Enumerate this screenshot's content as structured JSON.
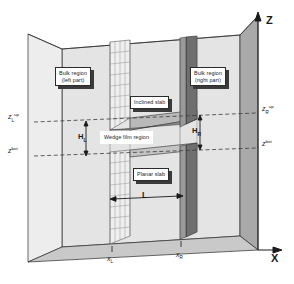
{
  "figure": {
    "type": "3d-schematic"
  },
  "axes": {
    "z_label": "Z",
    "x_label": "X",
    "x_ticks": [
      {
        "id": "xL",
        "base": "x",
        "sub": "L"
      },
      {
        "id": "xR",
        "base": "x",
        "sub": "R"
      }
    ],
    "z_ticks_left": [
      {
        "id": "zL_up",
        "base": "z",
        "sub": "L",
        "sup": "up"
      },
      {
        "id": "zL_bot",
        "base": "z",
        "sub": "",
        "sup": "bot"
      }
    ],
    "z_ticks_right": [
      {
        "id": "zR_up",
        "base": "z",
        "sub": "R",
        "sup": "up"
      },
      {
        "id": "zR_bot",
        "base": "z",
        "sub": "",
        "sup": "bot"
      }
    ]
  },
  "callouts": {
    "bulk_left": {
      "line1": "Bulk region",
      "line2": "(left part)"
    },
    "bulk_right": {
      "line1": "Bulk region",
      "line2": "(right part)"
    },
    "inclined_slab": {
      "line1": "Inclined slab"
    },
    "wedge_film": {
      "line1": "Wedge film region"
    },
    "planar_slab": {
      "line1": "Planar slab"
    }
  },
  "dimensions": {
    "height_left": {
      "base": "H",
      "sub": "L"
    },
    "height_right": {
      "base": "H",
      "sub": "R"
    },
    "length": "L"
  },
  "colors": {
    "line": "#2b2b2b",
    "wall_light": "#e9e9e9",
    "wall_mid": "#d2d2d2",
    "wall_dark": "#a8a8a8",
    "slab_dark": "#6f6f6f",
    "grid": "#8a8a8a",
    "dashed": "#3a3a3a",
    "shadow": "#3a3a3a"
  }
}
